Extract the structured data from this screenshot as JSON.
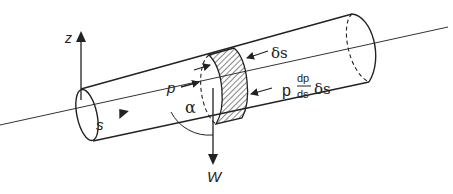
{
  "diagram": {
    "labels": {
      "z_axis": "z",
      "s": "s",
      "p": "p",
      "alpha": "α",
      "delta_s": "δs",
      "p_prefix": "p",
      "dp": "dp",
      "ds": "ds",
      "delta_s_suffix": "δs",
      "weight": "W"
    },
    "colors": {
      "stroke": "#222222",
      "background": "#ffffff"
    }
  }
}
